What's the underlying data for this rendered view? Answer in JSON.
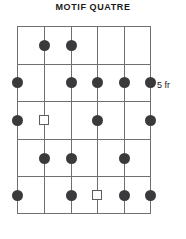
{
  "title": "MOTIF QUATRE",
  "fret_position_label": "5 fr",
  "colors": {
    "grid_line": "#6f6f70",
    "dot_fill": "#3a3a3c",
    "square_stroke": "#5c5c5e",
    "square_fill": "#ffffff",
    "text": "#1a1a1a",
    "background": "#ffffff"
  },
  "diagram": {
    "type": "guitar-fretboard",
    "strings": 6,
    "frets": 5,
    "string_labels": [
      "1",
      "2",
      "3",
      "4",
      "5",
      "6"
    ],
    "fret_labels": [
      "1",
      "2",
      "3",
      "4",
      "5"
    ],
    "markers": [
      {
        "fret": 1,
        "string": 2,
        "shape": "dot"
      },
      {
        "fret": 1,
        "string": 3,
        "shape": "dot"
      },
      {
        "fret": 2,
        "string": 1,
        "shape": "dot"
      },
      {
        "fret": 2,
        "string": 3,
        "shape": "dot"
      },
      {
        "fret": 2,
        "string": 4,
        "shape": "dot"
      },
      {
        "fret": 2,
        "string": 5,
        "shape": "dot"
      },
      {
        "fret": 2,
        "string": 6,
        "shape": "dot"
      },
      {
        "fret": 3,
        "string": 1,
        "shape": "dot"
      },
      {
        "fret": 3,
        "string": 2,
        "shape": "square"
      },
      {
        "fret": 3,
        "string": 4,
        "shape": "dot"
      },
      {
        "fret": 3,
        "string": 6,
        "shape": "dot"
      },
      {
        "fret": 4,
        "string": 2,
        "shape": "dot"
      },
      {
        "fret": 4,
        "string": 3,
        "shape": "dot"
      },
      {
        "fret": 4,
        "string": 5,
        "shape": "dot"
      },
      {
        "fret": 5,
        "string": 1,
        "shape": "dot"
      },
      {
        "fret": 5,
        "string": 3,
        "shape": "dot"
      },
      {
        "fret": 5,
        "string": 4,
        "shape": "square"
      },
      {
        "fret": 5,
        "string": 5,
        "shape": "dot"
      },
      {
        "fret": 5,
        "string": 6,
        "shape": "dot"
      }
    ]
  }
}
